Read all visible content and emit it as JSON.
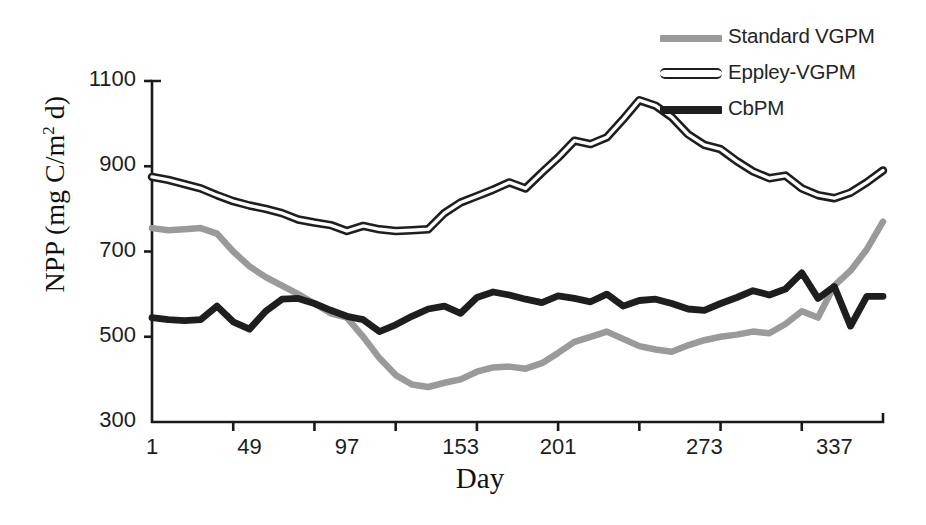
{
  "chart_data": {
    "type": "line",
    "title": "",
    "xlabel": "Day",
    "ylabel": "NPP (mg C/m2 d)",
    "ylabel_parts": {
      "prefix": "NPP (mg C/m",
      "sup": "2",
      "suffix": " d)"
    },
    "xlim": [
      1,
      365
    ],
    "ylim": [
      300,
      1100
    ],
    "ytick_labels": [
      "1100",
      "900",
      "700",
      "500",
      "300"
    ],
    "ytick_values": [
      1100,
      900,
      700,
      500,
      300
    ],
    "xtick_labels": [
      "1",
      "49",
      "97",
      "153",
      "201",
      "273",
      "337"
    ],
    "xtick_values": [
      1,
      49,
      97,
      153,
      201,
      273,
      337
    ],
    "grid": false,
    "legend_position": "top-right",
    "x": [
      1,
      9,
      17,
      25,
      33,
      41,
      49,
      57,
      65,
      73,
      81,
      89,
      97,
      105,
      113,
      121,
      129,
      137,
      145,
      153,
      161,
      169,
      177,
      185,
      193,
      201,
      209,
      217,
      225,
      233,
      241,
      249,
      257,
      265,
      273,
      281,
      289,
      297,
      305,
      313,
      321,
      329,
      337,
      345,
      353,
      361
    ],
    "series": [
      {
        "name": "Standard VGPM",
        "color": "#9a9a9a",
        "style": "solid-gray",
        "values": [
          755,
          750,
          752,
          755,
          742,
          700,
          665,
          640,
          620,
          600,
          578,
          555,
          545,
          500,
          450,
          410,
          388,
          382,
          392,
          400,
          418,
          428,
          430,
          425,
          438,
          462,
          488,
          500,
          512,
          495,
          478,
          470,
          465,
          480,
          492,
          500,
          505,
          512,
          508,
          530,
          560,
          545,
          620,
          655,
          705,
          770
        ]
      },
      {
        "name": "Eppley-VGPM",
        "color": "#1e1e1e",
        "style": "outlined",
        "values": [
          875,
          868,
          858,
          848,
          832,
          818,
          808,
          800,
          790,
          775,
          768,
          762,
          748,
          760,
          752,
          748,
          750,
          752,
          790,
          815,
          830,
          845,
          862,
          848,
          885,
          920,
          960,
          952,
          968,
          1010,
          1055,
          1042,
          1015,
          975,
          950,
          940,
          912,
          888,
          872,
          878,
          848,
          832,
          825,
          838,
          862,
          890
        ]
      },
      {
        "name": "CbPM",
        "color": "#1e1e1e",
        "style": "solid-black",
        "values": [
          545,
          540,
          538,
          540,
          572,
          535,
          518,
          560,
          588,
          590,
          578,
          562,
          548,
          540,
          512,
          528,
          548,
          565,
          572,
          555,
          592,
          605,
          598,
          588,
          580,
          596,
          590,
          582,
          600,
          572,
          585,
          588,
          578,
          565,
          562,
          578,
          592,
          608,
          598,
          612,
          650,
          590,
          618,
          525,
          595,
          595
        ]
      }
    ]
  },
  "legend": {
    "items": [
      {
        "label": "Standard VGPM",
        "swatch": "standard"
      },
      {
        "label": "Eppley-VGPM",
        "swatch": "eppley"
      },
      {
        "label": "CbPM",
        "swatch": "cbpm"
      }
    ]
  }
}
